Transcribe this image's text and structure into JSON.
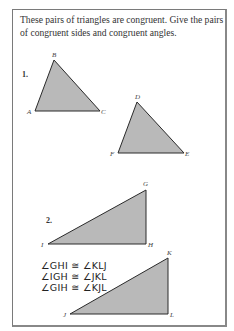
{
  "instructions": "These pairs of triangles are congruent. Give the pairs of congruent sides and congruent angles.",
  "problems": [
    {
      "number": "1.",
      "triangles": [
        {
          "vertices": {
            "A": [
              35,
              111
            ],
            "B": [
              54,
              60
            ],
            "C": [
              100,
              111
            ]
          },
          "labels": [
            "A",
            "B",
            "C"
          ]
        },
        {
          "vertices": {
            "D": [
              137,
              102
            ],
            "E": [
              184,
              153
            ],
            "F": [
              118,
              153
            ]
          },
          "labels": [
            "D",
            "E",
            "F"
          ]
        }
      ]
    },
    {
      "number": "2.",
      "triangles": [
        {
          "vertices": {
            "G": [
              146,
              190
            ],
            "H": [
              146,
              244
            ],
            "I": [
              48,
              244
            ]
          },
          "labels": [
            "G",
            "H",
            "I"
          ]
        },
        {
          "vertices": {
            "J": [
              70,
              314
            ],
            "K": [
              168,
              258
            ],
            "L": [
              168,
              314
            ]
          },
          "labels": [
            "J",
            "K",
            "L"
          ]
        }
      ],
      "handwritten_answers": [
        "∠GHI ≅ ∠KLJ",
        "∠IGH ≅ ∠JKL",
        "∠GIH ≅ ∠KJL"
      ]
    }
  ],
  "colors": {
    "triangle_fill": "#b9b9b9",
    "triangle_stroke": "#2a2a2a",
    "frame_border": "#7a7a7a"
  }
}
